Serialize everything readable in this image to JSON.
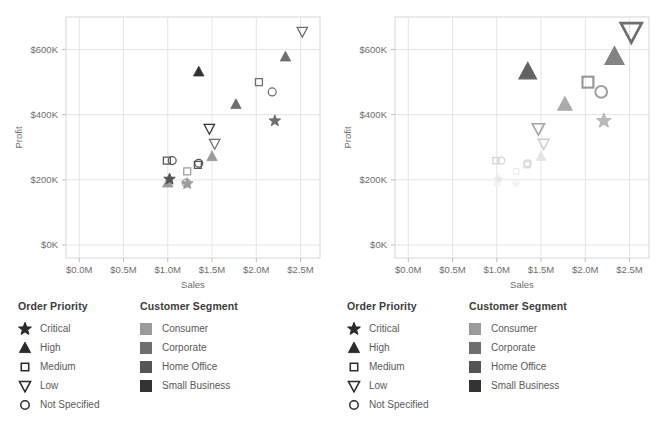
{
  "chart_data": [
    {
      "type": "scatter",
      "panel": "left",
      "title": "",
      "xlabel": "Sales",
      "ylabel": "Profit",
      "xlim": [
        -0.15,
        2.72
      ],
      "ylim": [
        -40000,
        700000
      ],
      "xticks": [
        "$0.0M",
        "$0.5M",
        "$1.0M",
        "$1.5M",
        "$2.0M",
        "$2.5M"
      ],
      "xtickvals": [
        0,
        0.5,
        1.0,
        1.5,
        2.0,
        2.5
      ],
      "yticks": [
        "$0K",
        "$200K",
        "$400K",
        "$600K"
      ],
      "ytickvals": [
        0,
        200000,
        400000,
        600000
      ],
      "grid": true,
      "legend_position": "below",
      "encoding": "shape=Order Priority, color=Customer Segment, constant size",
      "points": [
        {
          "x": 2.52,
          "y": 655000,
          "priority": "Low",
          "segment": "Corporate"
        },
        {
          "x": 2.33,
          "y": 578000,
          "priority": "High",
          "segment": "Corporate"
        },
        {
          "x": 1.35,
          "y": 532000,
          "priority": "High",
          "segment": "Small Business"
        },
        {
          "x": 2.03,
          "y": 500000,
          "priority": "Medium",
          "segment": "Corporate"
        },
        {
          "x": 2.18,
          "y": 470000,
          "priority": "Not Specified",
          "segment": "Corporate"
        },
        {
          "x": 1.77,
          "y": 432000,
          "priority": "High",
          "segment": "Corporate"
        },
        {
          "x": 2.21,
          "y": 381000,
          "priority": "Critical",
          "segment": "Corporate"
        },
        {
          "x": 1.47,
          "y": 357000,
          "priority": "Low",
          "segment": "Small Business"
        },
        {
          "x": 1.53,
          "y": 311000,
          "priority": "Low",
          "segment": "Corporate"
        },
        {
          "x": 1.5,
          "y": 272000,
          "priority": "High",
          "segment": "Consumer"
        },
        {
          "x": 0.99,
          "y": 259000,
          "priority": "Medium",
          "segment": "Home Office"
        },
        {
          "x": 1.05,
          "y": 259000,
          "priority": "Not Specified",
          "segment": "Home Office"
        },
        {
          "x": 1.35,
          "y": 251000,
          "priority": "Not Specified",
          "segment": "Home Office"
        },
        {
          "x": 1.34,
          "y": 246000,
          "priority": "Medium",
          "segment": "Home Office"
        },
        {
          "x": 1.22,
          "y": 226000,
          "priority": "Medium",
          "segment": "Consumer"
        },
        {
          "x": 1.02,
          "y": 202000,
          "priority": "Critical",
          "segment": "Home Office"
        },
        {
          "x": 1.0,
          "y": 191000,
          "priority": "High",
          "segment": "Consumer"
        },
        {
          "x": 1.21,
          "y": 190000,
          "priority": "Not Specified",
          "segment": "Consumer"
        },
        {
          "x": 1.22,
          "y": 188000,
          "priority": "Critical",
          "segment": "Consumer"
        }
      ]
    },
    {
      "type": "scatter",
      "panel": "right",
      "title": "",
      "xlabel": "Sales",
      "ylabel": "Profit",
      "xlim": [
        -0.15,
        2.72
      ],
      "ylim": [
        -40000,
        700000
      ],
      "xticks": [
        "$0.0M",
        "$0.5M",
        "$1.0M",
        "$1.5M",
        "$2.0M",
        "$2.5M"
      ],
      "xtickvals": [
        0,
        0.5,
        1.0,
        1.5,
        2.0,
        2.5
      ],
      "yticks": [
        "$0K",
        "$200K",
        "$400K",
        "$600K"
      ],
      "ytickvals": [
        0,
        200000,
        400000,
        600000
      ],
      "grid": true,
      "legend_position": "below",
      "encoding": "shape=Order Priority, color=Customer Segment, size and emphasis scaled by Profit",
      "points": [
        {
          "x": 2.52,
          "y": 655000,
          "priority": "Low",
          "segment": "Corporate"
        },
        {
          "x": 2.33,
          "y": 578000,
          "priority": "High",
          "segment": "Corporate"
        },
        {
          "x": 1.35,
          "y": 532000,
          "priority": "High",
          "segment": "Small Business"
        },
        {
          "x": 2.03,
          "y": 500000,
          "priority": "Medium",
          "segment": "Corporate"
        },
        {
          "x": 2.18,
          "y": 470000,
          "priority": "Not Specified",
          "segment": "Corporate"
        },
        {
          "x": 1.77,
          "y": 432000,
          "priority": "High",
          "segment": "Corporate"
        },
        {
          "x": 2.21,
          "y": 381000,
          "priority": "Critical",
          "segment": "Corporate"
        },
        {
          "x": 1.47,
          "y": 357000,
          "priority": "Low",
          "segment": "Small Business"
        },
        {
          "x": 1.53,
          "y": 311000,
          "priority": "Low",
          "segment": "Corporate"
        },
        {
          "x": 1.5,
          "y": 272000,
          "priority": "High",
          "segment": "Consumer"
        },
        {
          "x": 0.99,
          "y": 259000,
          "priority": "Medium",
          "segment": "Home Office"
        },
        {
          "x": 1.05,
          "y": 259000,
          "priority": "Not Specified",
          "segment": "Home Office"
        },
        {
          "x": 1.35,
          "y": 251000,
          "priority": "Not Specified",
          "segment": "Home Office"
        },
        {
          "x": 1.34,
          "y": 246000,
          "priority": "Medium",
          "segment": "Home Office"
        },
        {
          "x": 1.22,
          "y": 226000,
          "priority": "Medium",
          "segment": "Consumer"
        },
        {
          "x": 1.02,
          "y": 202000,
          "priority": "Critical",
          "segment": "Home Office"
        },
        {
          "x": 1.0,
          "y": 191000,
          "priority": "High",
          "segment": "Consumer"
        },
        {
          "x": 1.21,
          "y": 190000,
          "priority": "Not Specified",
          "segment": "Consumer"
        },
        {
          "x": 1.22,
          "y": 188000,
          "priority": "Critical",
          "segment": "Consumer"
        }
      ]
    }
  ],
  "legends": {
    "priority": {
      "title": "Order Priority",
      "items": [
        {
          "label": "Critical",
          "shape": "star"
        },
        {
          "label": "High",
          "shape": "triangle-up"
        },
        {
          "label": "Medium",
          "shape": "square"
        },
        {
          "label": "Low",
          "shape": "triangle-down"
        },
        {
          "label": "Not Specified",
          "shape": "circle"
        }
      ]
    },
    "segment": {
      "title": "Customer Segment",
      "items": [
        {
          "label": "Consumer",
          "color": "#9b9b9b"
        },
        {
          "label": "Corporate",
          "color": "#6e6e6e"
        },
        {
          "label": "Home Office",
          "color": "#555555"
        },
        {
          "label": "Small Business",
          "color": "#333333"
        }
      ]
    }
  },
  "colors": {
    "grid": "#e4e4e4",
    "frame": "#d6d6d6",
    "text": "#6e6e6e",
    "title": "#3c3c3c",
    "faded": "#d8d8d8"
  }
}
